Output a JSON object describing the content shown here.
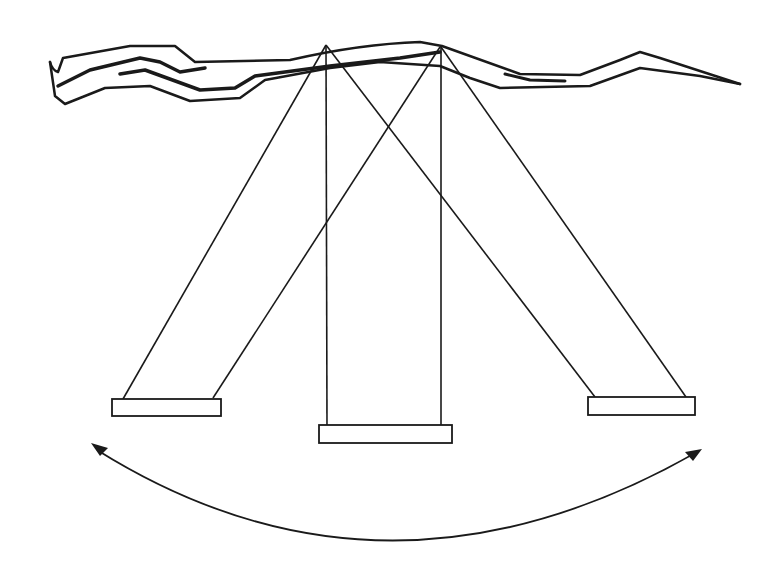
{
  "diagram": {
    "title": "",
    "elements": {
      "branch": {
        "label": "tree-branch"
      },
      "swings": [
        {
          "position": "left"
        },
        {
          "position": "center"
        },
        {
          "position": "right"
        }
      ],
      "motion_arrow": {
        "type": "double-headed-arc"
      }
    },
    "colors": {
      "stroke": "#1a1a1a",
      "background": "#ffffff"
    }
  }
}
